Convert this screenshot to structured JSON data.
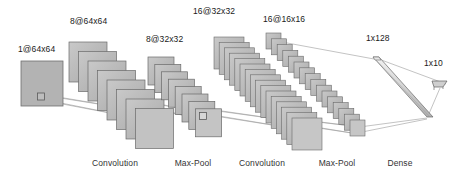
{
  "diagram": {
    "type": "cnn-architecture",
    "background_color": "#ffffff",
    "line_color": "#8c8c8c",
    "stroke_color": "#555555",
    "text_color": "#1a1a1a",
    "layer_labels": [
      {
        "id": "input",
        "text": "1@64x64",
        "x": 18,
        "y": 44
      },
      {
        "id": "conv1",
        "text": "8@64x64",
        "x": 70,
        "y": 16
      },
      {
        "id": "pool1",
        "text": "8@32x32",
        "x": 146,
        "y": 34
      },
      {
        "id": "conv2",
        "text": "16@32x32",
        "x": 193,
        "y": 6
      },
      {
        "id": "pool2",
        "text": "16@16x16",
        "x": 263,
        "y": 14
      },
      {
        "id": "dense1",
        "text": "1x128",
        "x": 366,
        "y": 33
      },
      {
        "id": "output",
        "text": "1x10",
        "x": 424,
        "y": 58
      }
    ],
    "stage_labels": [
      {
        "id": "stage-conv1",
        "text": "Convolution",
        "center_x": 115,
        "y": 158
      },
      {
        "id": "stage-pool1",
        "text": "Max-Pool",
        "center_x": 193,
        "y": 158
      },
      {
        "id": "stage-conv2",
        "text": "Convolution",
        "center_x": 262,
        "y": 158
      },
      {
        "id": "stage-pool2",
        "text": "Max-Pool",
        "center_x": 337,
        "y": 158
      },
      {
        "id": "stage-dense",
        "text": "Dense",
        "center_x": 400,
        "y": 158
      }
    ],
    "blocks": {
      "input": {
        "x": 21,
        "y": 61,
        "size": 42,
        "fill": "#b3b3b3"
      },
      "conv1": {
        "count": 8,
        "start_x": 69,
        "start_y": 42,
        "size": 38,
        "dx": 9.5,
        "dy": 9.5
      },
      "pool1": {
        "count": 8,
        "start_x": 148,
        "start_y": 57,
        "size": 26,
        "dx": 6.8,
        "dy": 7.4
      },
      "conv2": {
        "count": 16,
        "start_x": 214,
        "start_y": 37,
        "size": 30,
        "dx": 5.2,
        "dy": 5.4
      },
      "pool2": {
        "count": 16,
        "start_x": 266,
        "start_y": 33,
        "size": 15,
        "dx": 5.6,
        "dy": 5.8
      },
      "dense": {
        "x1": 373,
        "y1": 57,
        "x2": 429,
        "y2": 117,
        "thickness": 7
      },
      "out": {
        "x": 432,
        "y": 81,
        "w": 16,
        "h": 6
      }
    }
  }
}
